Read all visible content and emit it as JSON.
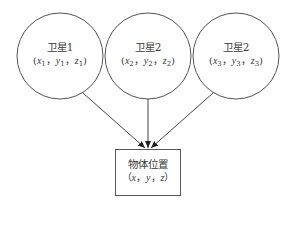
{
  "diagram": {
    "type": "flow",
    "colors": {
      "stroke": "#555555",
      "text": "#3a3a3a",
      "background": "#ffffff"
    },
    "satellites": [
      {
        "id": "sat1",
        "title": "卫星1",
        "coords": [
          "x1",
          "y1",
          "z1"
        ],
        "x_var": "x",
        "y_var": "y",
        "z_var": "z",
        "sub": "1",
        "cx": 60,
        "cy": 56,
        "r": 43
      },
      {
        "id": "sat2",
        "title": "卫星2",
        "coords": [
          "x2",
          "y2",
          "z2"
        ],
        "x_var": "x",
        "y_var": "y",
        "z_var": "z",
        "sub": "2",
        "cx": 148,
        "cy": 56,
        "r": 43
      },
      {
        "id": "sat3",
        "title": "卫星2",
        "coords": [
          "x3",
          "y3",
          "z3"
        ],
        "x_var": "x",
        "y_var": "y",
        "z_var": "z",
        "sub": "3",
        "cx": 236,
        "cy": 56,
        "r": 43
      }
    ],
    "target": {
      "title": "物体位置",
      "x_var": "x",
      "y_var": "y",
      "z_var": "z",
      "box": {
        "x": 115,
        "y": 149,
        "w": 65,
        "h": 46
      }
    },
    "edges": [
      {
        "from": "sat1",
        "to": "target"
      },
      {
        "from": "sat2",
        "to": "target"
      },
      {
        "from": "sat3",
        "to": "target"
      }
    ],
    "punct": {
      "open": "(",
      "close": ")",
      "sep": "，",
      "open_full": "（",
      "close_full": "）"
    }
  }
}
